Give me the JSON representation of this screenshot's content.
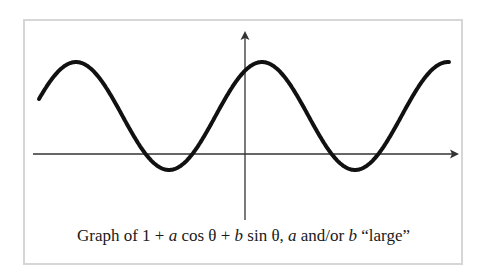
{
  "chart_data": {
    "type": "line",
    "title": "Graph of 1 + a cos θ + b sin θ, a and/or b “large”",
    "caption_parts": {
      "p1": "Graph of 1 + ",
      "a1": "a",
      "p2": " cos θ + ",
      "b1": "b",
      "p3": " sin θ, ",
      "a2": "a",
      "p4": " and/or ",
      "b2": "b",
      "p5": " “large”"
    },
    "function": "1 + a cos θ + b sin θ",
    "xlabel": "",
    "ylabel": "",
    "axes": {
      "x_axis_arrow": true,
      "y_axis_arrow": true,
      "tick_labels": "none"
    },
    "grid": false,
    "legend": null,
    "series": [
      {
        "name": "1 + R cos(θ − φ), R ≈ 1.42",
        "color": "#111111",
        "description": "Sinusoid oscillating above and below the θ-axis; maximum ≈ 1 + R ≈ 2.42, minimum ≈ 1 − R ≈ −0.42",
        "max": 2.42,
        "min": -0.42,
        "peaks_px_x": [
          76,
          262,
          449
        ],
        "troughs_px_x": [
          170,
          352
        ]
      }
    ],
    "ylim": [
      -1.0,
      3.2
    ]
  },
  "plot_geometry": {
    "x_axis_y": 154,
    "x_axis_start": 33,
    "x_axis_end": 459,
    "y_axis_x": 245,
    "y_axis_top": 31,
    "y_axis_bottom": 220,
    "curve_x_start": 39,
    "curve_x_end": 449,
    "peak_x": 262,
    "period_px": 186,
    "unit_px": 38,
    "amplitude": 1.42,
    "offset": 1
  },
  "colors": {
    "curve": "#111111",
    "axes": "#333333",
    "frame": "#d6d6d6",
    "text": "#1a1a1a"
  }
}
